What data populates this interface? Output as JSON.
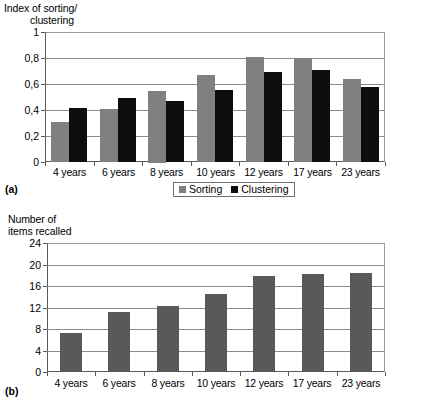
{
  "figure": {
    "panels": [
      {
        "caption": "(a)",
        "legend": {
          "entries": [
            {
              "label": "Sorting",
              "color": "#808080",
              "icon": "square-swatch-gray"
            },
            {
              "label": "Clustering",
              "color": "#0d0d0d",
              "icon": "square-swatch-black"
            }
          ]
        }
      },
      {
        "caption": "(b)"
      }
    ]
  },
  "chart_data": [
    {
      "type": "bar",
      "panel": "(a)",
      "title": "",
      "xlabel": "",
      "ylabel": "Index of sorting/\nclustering",
      "ylabel_lines": [
        "Index of sorting/",
        "clustering"
      ],
      "categories": [
        "4 years",
        "6 years",
        "8 years",
        "10 years",
        "12 years",
        "17 years",
        "23 years"
      ],
      "series": [
        {
          "name": "Sorting",
          "color": "#808080",
          "values": [
            0.31,
            0.41,
            0.55,
            0.67,
            0.81,
            0.8,
            0.635
          ]
        },
        {
          "name": "Clustering",
          "color": "#0d0d0d",
          "values": [
            0.415,
            0.49,
            0.47,
            0.555,
            0.695,
            0.71,
            0.58
          ]
        }
      ],
      "ylim": [
        0,
        1
      ],
      "yticks": [
        0,
        0.2,
        0.4,
        0.6,
        0.8,
        1
      ],
      "ytick_labels": [
        "0",
        "0,2",
        "0,4",
        "0,6",
        "0,8",
        "1"
      ],
      "grid": true,
      "legend_position": "bottom"
    },
    {
      "type": "bar",
      "panel": "(b)",
      "title": "",
      "xlabel": "",
      "ylabel": "Number of\nitems recalled",
      "ylabel_lines": [
        "Number of",
        "items recalled"
      ],
      "categories": [
        "4 years",
        "6 years",
        "8 years",
        "10 years",
        "12 years",
        "17 years",
        "23 years"
      ],
      "series": [
        {
          "name": "Number of items recalled",
          "color": "#595959",
          "values": [
            7.2,
            11.2,
            12.2,
            14.6,
            17.8,
            18.2,
            18.4
          ]
        }
      ],
      "ylim": [
        0,
        24
      ],
      "yticks": [
        0,
        4,
        8,
        12,
        16,
        20,
        24
      ],
      "ytick_labels": [
        "0",
        "4",
        "8",
        "12",
        "16",
        "20",
        "24"
      ],
      "grid": true,
      "legend_position": "none"
    }
  ]
}
